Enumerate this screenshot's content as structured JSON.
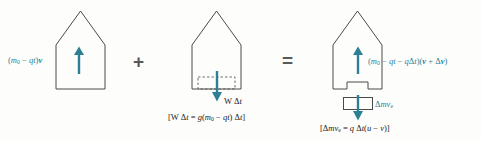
{
  "figure": {
    "colors": {
      "accent_teal": "#2d7f94",
      "outline_gray": "#4a4a4a",
      "operator_gray": "#595959",
      "background": "#fdfdfb"
    }
  },
  "operators": {
    "plus": "+",
    "equals": "="
  },
  "terms": [
    {
      "id": "initial-momentum",
      "rocket_label_html": "(<i>m</i><sub>0</sub> &minus; <i>qt</i>)<b><i>v</i></b>",
      "rocket_label_plain": "(m0 - qt)v",
      "arrow_direction": "up",
      "arrow_color": "#2d7f94",
      "has_nozzle": false,
      "has_notch": false,
      "has_exhaust_block": false
    },
    {
      "id": "weight-impulse",
      "arrow_label_html": "W &Delta;<i>t</i>",
      "arrow_label_plain": "W Dt",
      "bracket_equation_html": "[<span class=\"up\">W</span> &Delta;<i>t</i> = <i>g</i>(<i>m</i><sub>0</sub> &minus; <i>qt</i>) &Delta;<i>t</i>]",
      "bracket_equation_plain": "[W Dt = g(m0 - qt) Dt]",
      "arrow_direction": "down",
      "arrow_color": "#2d7f94",
      "has_nozzle": true,
      "has_notch": false,
      "has_exhaust_block": false
    },
    {
      "id": "final-momentum",
      "rocket_label_html": "(<i>m</i><sub>0</sub> &minus; <i>qt</i> &minus; <i>q</i>&Delta;<i>t</i>)(<b><i>v</i></b> + &Delta;<b><i>v</i></b>)",
      "rocket_label_plain": "(m0 - qt - qDt)(v + Dv)",
      "block_label_html": "&Delta;<i>mv<sub>e</sub></i>",
      "block_label_plain": "Dmv_e",
      "bracket_equation_html": "[&Delta;<i>mv<sub>e</sub></i> = <i>q</i> &Delta;<i>t</i>(<i>u</i> &minus; <i>v</i>)]",
      "bracket_equation_plain": "[Dmv_e = q Dt(u - v)]",
      "arrow_direction": "up",
      "block_arrow_direction": "down",
      "arrow_color": "#2d7f94",
      "has_nozzle": false,
      "has_notch": true,
      "has_exhaust_block": true
    }
  ]
}
